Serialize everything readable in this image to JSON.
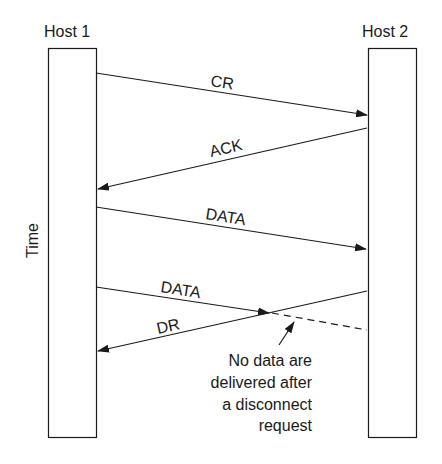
{
  "hosts": {
    "left": {
      "label": "Host 1"
    },
    "right": {
      "label": "Host 2"
    }
  },
  "axis": {
    "label": "Time"
  },
  "messages": [
    {
      "label": "CR",
      "direction": "host1-to-host2"
    },
    {
      "label": "ACK",
      "direction": "host2-to-host1"
    },
    {
      "label": "DATA",
      "direction": "host1-to-host2"
    },
    {
      "label": "DATA",
      "direction": "host1-to-host2",
      "lost": true
    },
    {
      "label": "DR",
      "direction": "host2-to-host1"
    }
  ],
  "annotation": {
    "lines": [
      "No data are",
      "delivered after",
      "a disconnect",
      "request"
    ]
  }
}
